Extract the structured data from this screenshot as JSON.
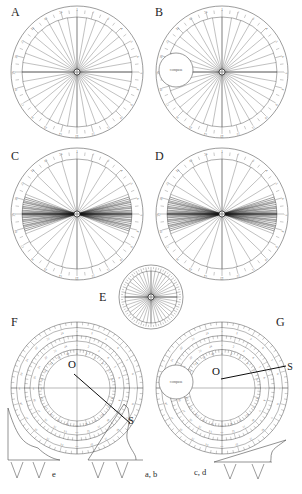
{
  "figure": {
    "kind": "multi-panel-polar-dial-figure",
    "background": "#ffffff",
    "ink": "#4a4a4a",
    "ink_dark": "#141414",
    "panel_letters": [
      "A",
      "B",
      "C",
      "D",
      "E",
      "F",
      "G"
    ],
    "center_label": "O",
    "source_label": "S",
    "compass_label": "compass"
  },
  "panels": [
    {
      "id": "A",
      "letter": "A",
      "type": "polar-dial",
      "cx": 77,
      "cy": 72,
      "r_outer": 66,
      "r_ticks": 55,
      "n_rays": 36,
      "ray_spread_deg": 360,
      "ray_center_deg": 0,
      "has_compass": false,
      "has_O": false,
      "has_S": false,
      "tick_labels": [
        "1",
        "2",
        "3",
        "4",
        "5",
        "6",
        "7",
        "8",
        "9",
        "10",
        "11",
        "12",
        "13",
        "14",
        "15",
        "16",
        "17",
        "18",
        "19",
        "20",
        "21",
        "22",
        "23",
        "24"
      ],
      "label_x": 13,
      "label_y": 8
    },
    {
      "id": "B",
      "letter": "B",
      "type": "polar-dial",
      "cx": 222,
      "cy": 72,
      "r_outer": 66,
      "r_ticks": 55,
      "n_rays": 36,
      "ray_spread_deg": 360,
      "ray_center_deg": 0,
      "has_compass": true,
      "compass_cx": 176,
      "compass_cy": 70,
      "compass_r": 17,
      "has_O": false,
      "has_S": false,
      "tick_labels": [
        "1",
        "2",
        "3",
        "4",
        "5",
        "6",
        "7",
        "8",
        "9",
        "10",
        "11",
        "12",
        "13",
        "14",
        "15",
        "16",
        "17",
        "18",
        "19",
        "20",
        "21",
        "22",
        "23",
        "24"
      ],
      "label_x": 157,
      "label_y": 8
    },
    {
      "id": "C",
      "letter": "C",
      "type": "polar-dial",
      "cx": 77,
      "cy": 214,
      "r_outer": 66,
      "r_ticks": 55,
      "n_rays": 44,
      "ray_spread_deg": 360,
      "ray_center_deg": 0,
      "beam_bias": "horizontal",
      "has_compass": false,
      "has_O": false,
      "has_S": false,
      "tick_labels": [
        "1",
        "2",
        "3",
        "4",
        "5",
        "6",
        "7",
        "8",
        "9",
        "10",
        "11",
        "12",
        "13",
        "14",
        "15",
        "16",
        "17",
        "18",
        "19",
        "20",
        "21",
        "22",
        "23",
        "24"
      ],
      "label_x": 13,
      "label_y": 152
    },
    {
      "id": "D",
      "letter": "D",
      "type": "polar-dial",
      "cx": 222,
      "cy": 214,
      "r_outer": 66,
      "r_ticks": 55,
      "n_rays": 44,
      "ray_spread_deg": 360,
      "ray_center_deg": 0,
      "beam_bias": "horizontal",
      "has_compass": false,
      "has_O": false,
      "has_S": false,
      "tick_labels": [
        "1",
        "2",
        "3",
        "4",
        "5",
        "6",
        "7",
        "8",
        "9",
        "10",
        "11",
        "12",
        "13",
        "14",
        "15",
        "16",
        "17",
        "18",
        "19",
        "20",
        "21",
        "22",
        "23",
        "24"
      ],
      "label_x": 157,
      "label_y": 152
    },
    {
      "id": "E",
      "letter": "E",
      "type": "polar-dial-small",
      "cx": 151,
      "cy": 297,
      "r_outer": 32,
      "r_ticks": 26,
      "n_rays": 40,
      "ray_spread_deg": 360,
      "ray_center_deg": 0,
      "has_compass": false,
      "has_O": false,
      "has_S": false,
      "tick_labels": [],
      "label_x": 100,
      "label_y": 293
    },
    {
      "id": "F",
      "letter": "F",
      "type": "polar-dial-rings",
      "cx": 77,
      "cy": 388,
      "r_outer": 66,
      "r_ticks": 56,
      "n_rays": 0,
      "ring_count": 4,
      "has_compass": false,
      "has_O": true,
      "O_x": 72,
      "O_y": 368,
      "has_S": true,
      "S_x": 131,
      "S_y": 424,
      "source_line": {
        "x1": 74,
        "y1": 374,
        "x2": 130,
        "y2": 423
      },
      "tick_labels": [
        "1",
        "2",
        "3",
        "4",
        "5",
        "6",
        "7",
        "8",
        "9",
        "10",
        "11",
        "12",
        "13",
        "14",
        "15",
        "16",
        "17",
        "18",
        "19",
        "20",
        "21",
        "22",
        "23",
        "24"
      ],
      "label_x": 13,
      "label_y": 318
    },
    {
      "id": "G",
      "letter": "G",
      "type": "polar-dial-rings",
      "cx": 222,
      "cy": 388,
      "r_outer": 66,
      "r_ticks": 56,
      "n_rays": 0,
      "ring_count": 4,
      "has_compass": true,
      "compass_cx": 176,
      "compass_cy": 382,
      "compass_r": 17,
      "has_O": true,
      "O_x": 216,
      "O_y": 375,
      "has_S": true,
      "S_x": 290,
      "S_y": 370,
      "source_line": {
        "x1": 221,
        "y1": 379,
        "x2": 286,
        "y2": 366
      },
      "tick_labels": [
        "1",
        "2",
        "3",
        "4",
        "5",
        "6",
        "7",
        "8",
        "9",
        "10",
        "11",
        "12",
        "13",
        "14",
        "15",
        "16",
        "17",
        "18",
        "19",
        "20",
        "21",
        "22",
        "23",
        "24"
      ],
      "label_x": 276,
      "label_y": 318
    }
  ],
  "waveforms": [
    {
      "id": "wave-e",
      "label": "e",
      "label_x": 53,
      "label_y": 475,
      "shape": "decaying-spike",
      "axis_x": 8,
      "axis_y_top": 408,
      "axis_y_base": 460,
      "axis_x_end": 60,
      "ticks": 2
    },
    {
      "id": "wave-ab",
      "label": "a, b",
      "label_x": 146,
      "label_y": 475,
      "shape": "rising-ramp-with-lobe",
      "axis_x": 88,
      "axis_y_top": 404,
      "axis_y_base": 460,
      "axis_x_end": 143,
      "ticks": 2
    },
    {
      "id": "wave-cd",
      "label": "c, d",
      "label_x": 196,
      "label_y": 472,
      "shape": "shallow-ramp",
      "axis_x": 214,
      "axis_y_top": 440,
      "axis_y_base": 462,
      "axis_x_end": 290,
      "ticks": 2
    }
  ]
}
